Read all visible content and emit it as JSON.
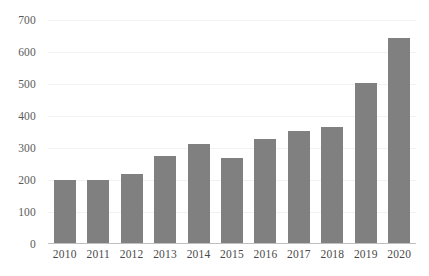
{
  "chart_data": {
    "type": "bar",
    "title": "",
    "subtitle": "",
    "xlabel": "",
    "ylabel": "",
    "categories": [
      "2010",
      "2011",
      "2012",
      "2013",
      "2014",
      "2015",
      "2016",
      "2017",
      "2018",
      "2019",
      "2020"
    ],
    "values": [
      200,
      201,
      218,
      276,
      313,
      268,
      328,
      353,
      367,
      504,
      645
    ],
    "series": [
      {
        "name": "",
        "values": [
          200,
          201,
          218,
          276,
          313,
          268,
          328,
          353,
          367,
          504,
          645
        ]
      }
    ],
    "ylim": [
      0,
      700
    ],
    "ytick_step": 100,
    "ytick_labels": [
      "0",
      "100",
      "200",
      "300",
      "400",
      "500",
      "600",
      "700"
    ],
    "ytick_values": [
      0,
      100,
      200,
      300,
      400,
      500,
      600,
      700
    ],
    "grid": true,
    "grid_axis": "y",
    "legend": false,
    "legend_position": "none",
    "bar_color": "#808080",
    "gridline_color": "#f2f2f2",
    "axis_color": "#bfbfbf",
    "label_color": "#4a4a4a",
    "background_color": "#ffffff"
  }
}
